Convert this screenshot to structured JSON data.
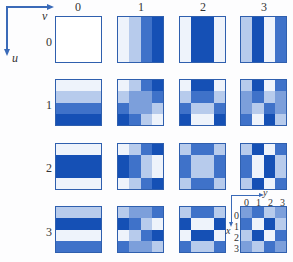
{
  "axes": {
    "horizontal_label": "v",
    "vertical_label": "u"
  },
  "column_labels": [
    "0",
    "1",
    "2",
    "3"
  ],
  "row_labels": [
    "0",
    "1",
    "2",
    "3"
  ],
  "inset": {
    "horizontal_label": "y",
    "vertical_label": "x",
    "column_ticks": [
      "0",
      "1",
      "2",
      "3"
    ],
    "row_ticks": [
      "0",
      "1",
      "2",
      "3"
    ]
  },
  "palette": [
    "#eef3fb",
    "#b7cbec",
    "#7c9fdb",
    "#3f72c9",
    "#1550b5"
  ],
  "tiles": [
    [
      [
        [
          0,
          0,
          0,
          0
        ],
        [
          0,
          0,
          0,
          0
        ],
        [
          0,
          0,
          0,
          0
        ],
        [
          0,
          0,
          0,
          0
        ]
      ],
      [
        [
          0,
          1,
          3,
          4
        ],
        [
          0,
          1,
          3,
          4
        ],
        [
          0,
          1,
          3,
          4
        ],
        [
          0,
          1,
          3,
          4
        ]
      ],
      [
        [
          0,
          4,
          4,
          0
        ],
        [
          0,
          4,
          4,
          0
        ],
        [
          0,
          4,
          4,
          0
        ],
        [
          0,
          4,
          4,
          0
        ]
      ],
      [
        [
          1,
          4,
          0,
          3
        ],
        [
          1,
          4,
          0,
          3
        ],
        [
          1,
          4,
          0,
          3
        ],
        [
          1,
          4,
          0,
          3
        ]
      ]
    ],
    [
      [
        [
          0,
          0,
          0,
          0
        ],
        [
          1,
          1,
          1,
          1
        ],
        [
          3,
          3,
          3,
          3
        ],
        [
          4,
          4,
          4,
          4
        ]
      ],
      [
        [
          0,
          1,
          3,
          4
        ],
        [
          1,
          2,
          2,
          3
        ],
        [
          3,
          2,
          2,
          1
        ],
        [
          4,
          3,
          1,
          0
        ]
      ],
      [
        [
          0,
          4,
          4,
          0
        ],
        [
          1,
          3,
          3,
          1
        ],
        [
          3,
          1,
          1,
          3
        ],
        [
          4,
          0,
          0,
          4
        ]
      ],
      [
        [
          1,
          4,
          0,
          3
        ],
        [
          2,
          3,
          1,
          2
        ],
        [
          2,
          1,
          3,
          2
        ],
        [
          3,
          0,
          4,
          1
        ]
      ]
    ],
    [
      [
        [
          0,
          0,
          0,
          0
        ],
        [
          4,
          4,
          4,
          4
        ],
        [
          4,
          4,
          4,
          4
        ],
        [
          0,
          0,
          0,
          0
        ]
      ],
      [
        [
          0,
          1,
          3,
          4
        ],
        [
          4,
          3,
          1,
          0
        ],
        [
          4,
          3,
          1,
          0
        ],
        [
          0,
          1,
          3,
          4
        ]
      ],
      [
        [
          1,
          3,
          3,
          1
        ],
        [
          3,
          1,
          1,
          3
        ],
        [
          3,
          1,
          1,
          3
        ],
        [
          1,
          3,
          3,
          1
        ]
      ],
      [
        [
          1,
          4,
          0,
          3
        ],
        [
          3,
          0,
          4,
          1
        ],
        [
          3,
          0,
          4,
          1
        ],
        [
          1,
          4,
          0,
          3
        ]
      ]
    ],
    [
      [
        [
          1,
          1,
          1,
          1
        ],
        [
          4,
          4,
          4,
          4
        ],
        [
          0,
          0,
          0,
          0
        ],
        [
          3,
          3,
          3,
          3
        ]
      ],
      [
        [
          1,
          2,
          2,
          3
        ],
        [
          4,
          3,
          1,
          0
        ],
        [
          0,
          1,
          3,
          4
        ],
        [
          3,
          2,
          2,
          1
        ]
      ],
      [
        [
          1,
          3,
          3,
          1
        ],
        [
          4,
          0,
          0,
          4
        ],
        [
          0,
          4,
          4,
          0
        ],
        [
          3,
          1,
          1,
          3
        ]
      ],
      [
        [
          2,
          3,
          1,
          2
        ],
        [
          3,
          0,
          4,
          1
        ],
        [
          1,
          4,
          0,
          3
        ],
        [
          2,
          1,
          3,
          2
        ]
      ]
    ]
  ]
}
